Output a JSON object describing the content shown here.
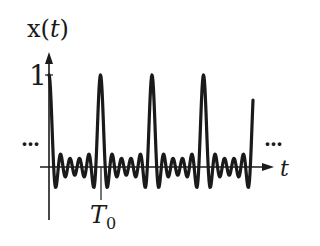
{
  "diagram": {
    "y_label_prefix": "x(",
    "y_label_var": "t",
    "y_label_suffix": ")",
    "x_label": "t",
    "y_tick_label": "1",
    "period_label_main": "T",
    "period_label_sub": "0",
    "ellipsis_left": "...",
    "ellipsis_right": "...",
    "colors": {
      "stroke": "#1a1a1a",
      "background": "#ffffff"
    }
  },
  "chart_data": {
    "type": "line",
    "xlabel": "t",
    "ylabel": "x(t)",
    "y_ticks": [
      1
    ],
    "x_ticks": [
      "T0"
    ],
    "peak_value": 1,
    "num_harmonics": 5,
    "peaks_at_multiples_of": "T0",
    "visible_periods": 4,
    "grid": false,
    "legend": null
  }
}
